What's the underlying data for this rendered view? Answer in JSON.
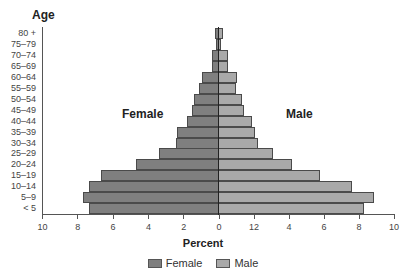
{
  "chart_data": {
    "type": "bar",
    "orientation": "horizontal",
    "subtype": "population-pyramid",
    "title": "",
    "ylabel": "Age",
    "xlabel": "Percent",
    "categories": [
      "80 +",
      "75–79",
      "70–74",
      "65–69",
      "60–64",
      "55–59",
      "50–54",
      "45–49",
      "40–44",
      "35–39",
      "30–34",
      "25–29",
      "20–24",
      "15–19",
      "10–14",
      "5–9",
      "< 5"
    ],
    "series": [
      {
        "name": "Female",
        "side": "left",
        "color": "#7f7f7f",
        "values": [
          0.2,
          0.15,
          0.35,
          0.4,
          0.95,
          1.1,
          1.4,
          1.5,
          1.8,
          2.35,
          2.45,
          3.4,
          4.7,
          6.7,
          7.4,
          7.75,
          7.4
        ]
      },
      {
        "name": "Male",
        "side": "right",
        "color": "#a9a9a9",
        "values": [
          0.25,
          0.15,
          0.55,
          0.55,
          1.05,
          1.0,
          1.35,
          1.45,
          1.9,
          2.1,
          2.25,
          3.1,
          4.2,
          5.8,
          7.6,
          8.9,
          8.3
        ]
      }
    ],
    "xlim": [
      -10,
      10
    ],
    "x_ticks_left": [
      "10",
      "8",
      "6",
      "4",
      "2",
      "0"
    ],
    "x_ticks_right": [
      "12",
      "4",
      "6",
      "8",
      "10"
    ],
    "grid": false,
    "legend_position": "bottom",
    "annotations": [
      "Female",
      "Male"
    ]
  },
  "labels": {
    "age_title": "Age",
    "female_annotation": "Female",
    "male_annotation": "Male",
    "x_title": "Percent",
    "legend_female": "Female",
    "legend_male": "Male"
  }
}
